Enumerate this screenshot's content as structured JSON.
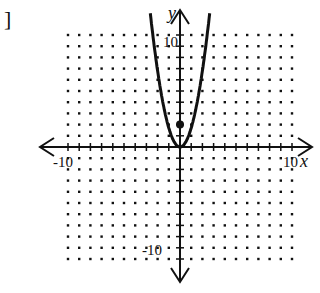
{
  "bracket": "]",
  "axes": {
    "x_label": "x",
    "y_label": "y",
    "x_min_label": "-10",
    "x_max_label": "10",
    "y_max_label": "10",
    "y_min_label": "-10"
  },
  "colors": {
    "ink": "#111111",
    "background": "#ffffff"
  },
  "chart_data": {
    "type": "line",
    "title": "",
    "xlabel": "x",
    "ylabel": "y",
    "xlim": [
      -10,
      10
    ],
    "ylim": [
      -10,
      10
    ],
    "grid": "dotted lattice, 1-unit spacing",
    "series": [
      {
        "name": "parabola",
        "equation_approx": "y = 1.7x^2",
        "vertex": [
          0,
          0
        ],
        "points": [
          [
            -2.5,
            10.5
          ],
          [
            -2,
            6.8
          ],
          [
            -1,
            1.7
          ],
          [
            0,
            0
          ],
          [
            1,
            1.7
          ],
          [
            2,
            6.8
          ],
          [
            2.5,
            10.5
          ]
        ]
      }
    ],
    "marked_points": [
      [
        0,
        2
      ]
    ],
    "tick_labels": {
      "x": [
        "-10",
        "10"
      ],
      "y": [
        "10",
        "-10"
      ]
    }
  }
}
